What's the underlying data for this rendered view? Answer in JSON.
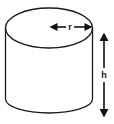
{
  "figure": {
    "name": "cylinder-diagram",
    "shape_type": "cylinder",
    "background_color": "#ffffff",
    "stroke_color": "#1a1a1a",
    "fill_color": "#ffffff"
  },
  "labels": {
    "radius": "r",
    "height": "h"
  },
  "annotations": {
    "radius_dimension": {
      "label": "r",
      "orientation": "horizontal",
      "arrow_style": "double-headed",
      "from_x": 50,
      "to_x": 92,
      "y": 27
    },
    "height_dimension": {
      "label": "h",
      "orientation": "vertical",
      "arrow_style": "double-headed",
      "x": 104,
      "from_y": 33,
      "to_y": 117
    }
  },
  "geometry": {
    "top_ellipse": {
      "cx": 49,
      "cy": 28,
      "rx": 43.5,
      "ry": 20
    },
    "left_wall_x": 5.5,
    "right_wall_x": 92.5,
    "body_top_y": 28,
    "body_bottom_y": 99,
    "bottom_arc_depth_y": 113
  }
}
